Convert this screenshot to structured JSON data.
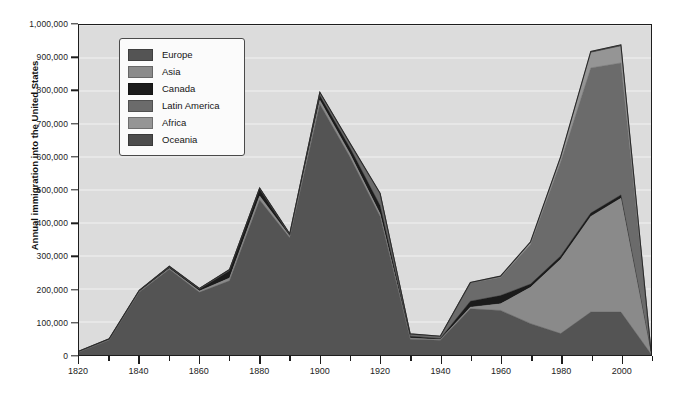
{
  "chart_data": {
    "type": "area",
    "stacked": true,
    "title": "",
    "xlabel": "",
    "ylabel": "Annual immigration into the United States",
    "xlim": [
      1820,
      2010
    ],
    "ylim": [
      0,
      1000000
    ],
    "grid": true,
    "legend_position": "top-left",
    "x_major_step": 20,
    "x_minor_step": 10,
    "y_step": 100000,
    "x_tick_labels": [
      "1820",
      "1840",
      "1860",
      "1880",
      "1900",
      "1920",
      "1940",
      "1960",
      "1980",
      "2000"
    ],
    "y_tick_labels": [
      "0",
      "100,000",
      "200,000",
      "300,000",
      "400,000",
      "500,000",
      "600,000",
      "700,000",
      "800,000",
      "900,000",
      "1,000,000"
    ],
    "x": [
      1820,
      1830,
      1840,
      1850,
      1860,
      1870,
      1880,
      1890,
      1900,
      1910,
      1920,
      1930,
      1940,
      1950,
      1960,
      1970,
      1980,
      1990,
      2000,
      2010
    ],
    "series": [
      {
        "name": "Europe",
        "color": "#545454",
        "values": [
          8000,
          45000,
          190000,
          260000,
          190000,
          225000,
          470000,
          355000,
          760000,
          600000,
          420000,
          48000,
          45000,
          140000,
          135000,
          95000,
          65000,
          130000,
          130000,
          3000
        ]
      },
      {
        "name": "Asia",
        "color": "#8a8a8a",
        "values": [
          1000,
          1000,
          2000,
          2000,
          4000,
          8000,
          12000,
          5000,
          12000,
          10000,
          8000,
          3000,
          2000,
          5000,
          20000,
          110000,
          225000,
          290000,
          345000,
          2000
        ]
      },
      {
        "name": "Canada",
        "color": "#1b1b1b",
        "values": [
          1000,
          1000,
          2000,
          4000,
          5000,
          22000,
          20000,
          3000,
          14000,
          18000,
          25000,
          6000,
          3000,
          18000,
          25000,
          10000,
          10000,
          10000,
          10000,
          1000
        ]
      },
      {
        "name": "Latin America",
        "color": "#6b6b6b",
        "values": [
          1000,
          1000,
          1000,
          2000,
          2000,
          3000,
          3000,
          3000,
          8000,
          12000,
          35000,
          6000,
          6000,
          55000,
          55000,
          120000,
          285000,
          440000,
          400000,
          4000
        ]
      },
      {
        "name": "Africa",
        "color": "#959595",
        "values": [
          500,
          500,
          500,
          500,
          500,
          500,
          500,
          500,
          1000,
          1000,
          1000,
          500,
          500,
          1000,
          2000,
          5000,
          12000,
          45000,
          50000,
          500
        ]
      },
      {
        "name": "Oceania",
        "color": "#4c4c4c",
        "values": [
          500,
          500,
          500,
          500,
          500,
          500,
          500,
          500,
          1000,
          1000,
          1000,
          500,
          500,
          1000,
          2000,
          3000,
          4000,
          5000,
          5000,
          500
        ]
      }
    ],
    "totals": [
      12000,
      49000,
      196000,
      269000,
      202000,
      259000,
      506000,
      367000,
      796000,
      642000,
      490000,
      64000,
      57000,
      220000,
      239000,
      343000,
      601000,
      920000,
      940000,
      11000
    ]
  },
  "legend": {
    "items": [
      {
        "label": "Europe",
        "color": "#545454"
      },
      {
        "label": "Asia",
        "color": "#8a8a8a"
      },
      {
        "label": "Canada",
        "color": "#1b1b1b"
      },
      {
        "label": "Latin America",
        "color": "#6b6b6b"
      },
      {
        "label": "Africa",
        "color": "#959595"
      },
      {
        "label": "Oceania",
        "color": "#4c4c4c"
      }
    ]
  },
  "colors": {
    "plot_background": "#dcdcdc",
    "page_background": "#ffffff",
    "axis": "#1d1d1d",
    "gridline": "#f2f2f2",
    "text": "#1c1c1c"
  }
}
